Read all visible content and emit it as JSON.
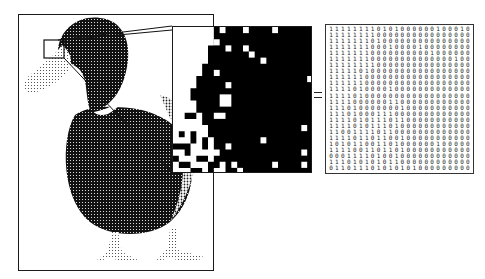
{
  "figure": {
    "equals_symbol": "=",
    "colors": {
      "ink": "#111111",
      "paper": "#ffffff",
      "frame": "#1a1a1a"
    },
    "duck_panel": {
      "label": "halftone duck image",
      "highlight_box": {
        "x": 44,
        "y": 40,
        "w": 20,
        "h": 18
      }
    },
    "zoom_panel": {
      "label": "magnified pixel grid",
      "grid_size": [
        24,
        24
      ]
    },
    "matrix": {
      "label": "binary pixel matrix",
      "rows": [
        "111111110101000000100010000",
        "111111110000000000000000000",
        "111111101000000000000000000",
        "111111100010000100000000000",
        "111111100000000001000000000",
        "111111100000000000000100000",
        "111111110000000000000000000",
        "111110100000000000000000000",
        "111111000000000000000000000",
        "111111000000000000000000001",
        "111101000010000000000000000",
        "111101000000000000000000000",
        "111100000011000000000000000",
        "111010000000100000000000000",
        "111010001110000000000000000",
        "111101011101100000000000000",
        "111101011101000000000000000",
        "110011110110000000000000010",
        "111101101100100000000000000",
        "101011001101000000100000000",
        "111100110110100000000000000",
        "000111101001000000000000010",
        "111010101011000000000000000",
        "011011101010101000000000000",
        "101101010101110000000010001",
        "110100001010100100000000000"
      ]
    }
  }
}
